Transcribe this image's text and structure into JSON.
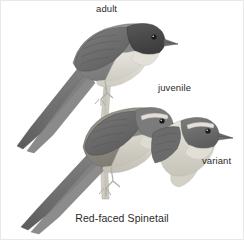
{
  "plate": {
    "caption": "Red-faced Spinetail",
    "background_color": "#ffffff",
    "border_color": "#e8e8e8",
    "text_color": "#2b2b2b",
    "width": 244,
    "height": 240
  },
  "labels": {
    "adult": "adult",
    "juvenile": "juvenile",
    "variant": "variant"
  },
  "figures": [
    {
      "id": "adult",
      "label": "adult",
      "pose": "perched, full body, long graduated tail to lower-left",
      "colors": {
        "crown": "#4a4a4a",
        "back": "#8a8a8a",
        "wing": "#6f6f6f",
        "tail": "#747474",
        "underparts": "#d8d5cd",
        "throat": "#e4e2da",
        "bill": "#6b6b6b",
        "eye": "#1a1a1a",
        "leg": "#b8b4aa"
      }
    },
    {
      "id": "juvenile",
      "label": "juvenile",
      "pose": "perched, full body, pale supercilium, long graduated tail to lower-left",
      "colors": {
        "crown": "#7b7b7b",
        "supercilium": "#e0ded6",
        "back": "#8f8c84",
        "wing": "#6a6a6a",
        "tail": "#787878",
        "underparts": "#ccc8be",
        "bill": "#6b6b6b",
        "eye": "#1a1a1a",
        "leg": "#b8b4aa"
      }
    },
    {
      "id": "variant",
      "label": "variant",
      "pose": "head and breast only, facing right, pale supercilium",
      "colors": {
        "crown": "#6e6e6e",
        "supercilium": "#e2e0d8",
        "nape": "#7f7f7f",
        "breast": "#d2cfc6",
        "bill": "#6b6b6b",
        "eye": "#1a1a1a"
      }
    }
  ],
  "perch": {
    "id": "branch",
    "description": "thin vertical branch the adult and juvenile grip",
    "color": "#c9c6bd"
  }
}
